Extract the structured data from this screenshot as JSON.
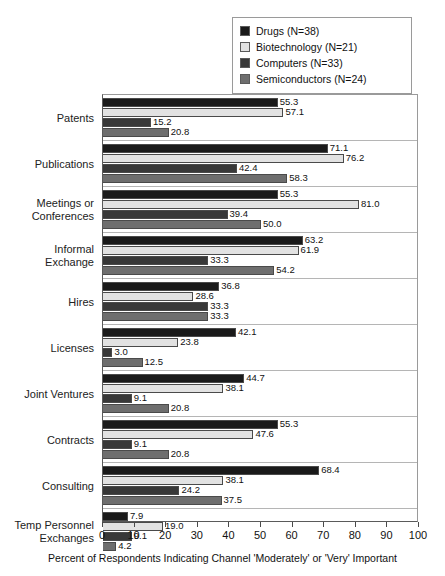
{
  "chart_data": {
    "type": "bar",
    "orientation": "horizontal",
    "title": "",
    "xlabel": "Percent of Respondents Indicating Channel 'Moderately' or 'Very' Important",
    "ylabel": "",
    "xlim": [
      0,
      100
    ],
    "xticks": [
      0,
      10,
      20,
      30,
      40,
      50,
      60,
      70,
      80,
      90,
      100
    ],
    "grid": false,
    "legend_position": "top-right",
    "categories": [
      "Patents",
      "Publications",
      "Meetings or\nConferences",
      "Informal\nExchange",
      "Hires",
      "Licenses",
      "Joint Ventures",
      "Contracts",
      "Consulting",
      "Temp Personnel\nExchanges"
    ],
    "series": [
      {
        "name": "Drugs (N=38)",
        "color": "#1a1a1a",
        "values": [
          55.3,
          71.1,
          55.3,
          63.2,
          36.8,
          42.1,
          44.7,
          55.3,
          68.4,
          7.9
        ]
      },
      {
        "name": "Biotechnology (N=21)",
        "color": "#e2e2e2",
        "values": [
          57.1,
          76.2,
          81.0,
          61.9,
          28.6,
          23.8,
          38.1,
          47.6,
          38.1,
          19.0
        ]
      },
      {
        "name": "Computers (N=33)",
        "color": "#383838",
        "values": [
          15.2,
          42.4,
          39.4,
          33.3,
          33.3,
          3.0,
          9.1,
          9.1,
          24.2,
          9.1
        ]
      },
      {
        "name": "Semiconductors (N=24)",
        "color": "#6e6e6e",
        "values": [
          20.8,
          58.3,
          50.0,
          54.2,
          33.3,
          12.5,
          20.8,
          20.8,
          37.5,
          4.2
        ]
      }
    ],
    "value_labels": [
      [
        "55.3",
        "57.1",
        "15.2",
        "20.8"
      ],
      [
        "71.1",
        "76.2",
        "42.4",
        "58.3"
      ],
      [
        "55.3",
        "81.0",
        "39.4",
        "50.0"
      ],
      [
        "63.2",
        "61.9",
        "33.3",
        "54.2"
      ],
      [
        "36.8",
        "28.6",
        "33.3",
        "33.3"
      ],
      [
        "42.1",
        "23.8",
        "3.0",
        "12.5"
      ],
      [
        "44.7",
        "38.1",
        "9.1",
        "20.8"
      ],
      [
        "55.3",
        "47.6",
        "9.1",
        "20.8"
      ],
      [
        "68.4",
        "38.1",
        "24.2",
        "37.5"
      ],
      [
        "7.9",
        "19.0",
        "9.1",
        "4.2"
      ]
    ]
  },
  "legend": {
    "items": [
      {
        "label": "Drugs (N=38)",
        "color": "#1a1a1a"
      },
      {
        "label": "Biotechnology (N=21)",
        "color": "#e2e2e2"
      },
      {
        "label": "Computers (N=33)",
        "color": "#383838"
      },
      {
        "label": "Semiconductors (N=24)",
        "color": "#6e6e6e"
      }
    ]
  },
  "axis": {
    "x_title": "Percent of Respondents Indicating Channel 'Moderately' or 'Very' Important",
    "tick_labels": [
      "0",
      "10",
      "20",
      "30",
      "40",
      "50",
      "60",
      "70",
      "80",
      "90",
      "100"
    ]
  }
}
